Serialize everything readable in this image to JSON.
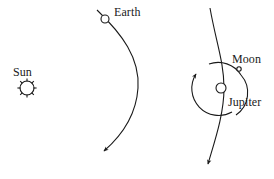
{
  "figure": {
    "background_color": "#ffffff",
    "ink_color": "#1a1a1a",
    "width": 274,
    "height": 179
  },
  "labels": {
    "sun": "Sun",
    "earth": "Earth",
    "moon": "Moon",
    "jupiter": "Jupiter"
  },
  "bodies": {
    "sun": {
      "name": "Sun",
      "symbol": "sun-with-rays",
      "cx": 27,
      "cy": 88,
      "r": 7,
      "ray_count": 8
    },
    "earth": {
      "name": "Earth",
      "symbol": "open-circle",
      "cx": 105,
      "cy": 19,
      "r": 4
    },
    "jupiter": {
      "name": "Jupiter",
      "symbol": "open-circle",
      "cx": 221,
      "cy": 88,
      "r": 5
    },
    "moon": {
      "name": "Moon",
      "symbol": "small-open-circle",
      "cx": 239,
      "cy": 69,
      "r": 2.2
    }
  },
  "paths": {
    "earth_trajectory": {
      "name": "earth-trajectory",
      "description": "curved arrow sweeping from upper left, bowing right, ending with arrowhead at lower left",
      "d": "M 97 10 C 122 34 140 58 138 88 C 136 118 119 138 104 151",
      "arrow_at": "end"
    },
    "jupiter_trajectory": {
      "name": "jupiter-trajectory",
      "description": "near vertical curved arrow passing through the Jupiter system, arrowhead at bottom",
      "d": "M 210 8 C 216 42 224 62 224 88 C 224 114 215 140 208 164",
      "arrow_at": "end"
    },
    "moon_orbit": {
      "name": "moon-orbit",
      "description": "circular orbit of the Moon about Jupiter, drawn as two arcs with an arrowhead showing counter-clockwise motion",
      "cx": 221,
      "cy": 88,
      "r": 27,
      "direction": "counter-clockwise",
      "arc_right_d": "M 209 64 A 27 27 0 0 1 241 75 A 27 27 0 0 1 236 115",
      "arc_left_d": "M 232 112 A 27 27 0 0 1 195 80",
      "arrow_tip": {
        "x": 198,
        "y": 72
      }
    }
  }
}
